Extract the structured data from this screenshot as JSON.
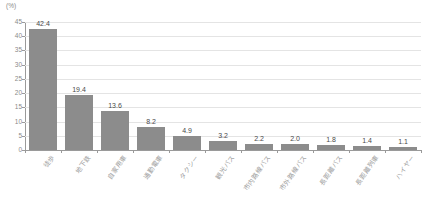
{
  "chart_data": {
    "type": "bar",
    "title": "",
    "subtitle": "",
    "xlabel": "",
    "ylabel": "",
    "unit_label": "(%)",
    "ylim": [
      0,
      45
    ],
    "ytick_step": 5,
    "yticks": [
      "45",
      "40",
      "35",
      "30",
      "25",
      "20",
      "15",
      "10",
      "5",
      "0"
    ],
    "grid": true,
    "legend": false,
    "bar_color": "#8c8c8c",
    "categories": [
      "徒歩",
      "地下鉄",
      "自家用車",
      "通勤電車",
      "タクシー",
      "観光バス",
      "市内路線バス",
      "市外路線バス",
      "長距離バス",
      "長距離列車",
      "ハイヤー"
    ],
    "values": [
      42.4,
      19.4,
      13.6,
      8.2,
      4.9,
      3.2,
      2.2,
      2.0,
      1.8,
      1.4,
      1.1
    ],
    "value_labels": [
      "42.4",
      "19.4",
      "13.6",
      "8.2",
      "4.9",
      "3.2",
      "2.2",
      "2.0",
      "1.8",
      "1.4",
      "1.1"
    ]
  }
}
